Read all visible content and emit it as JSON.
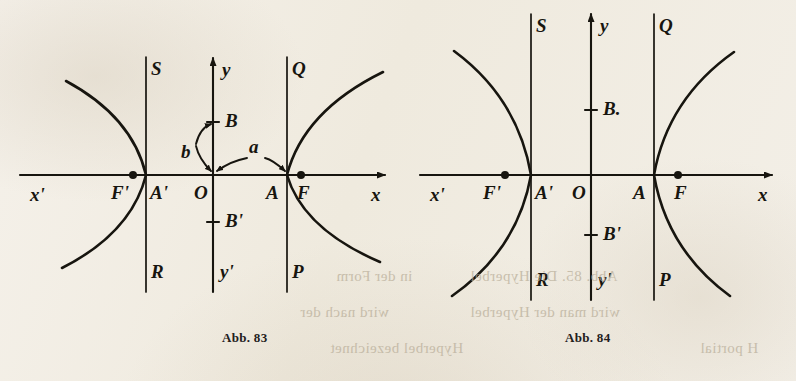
{
  "page": {
    "background_color": "#f2eee6",
    "ink_color": "#17150f",
    "bleed_ink_color": "#b9ae99"
  },
  "bleed_through_text": [
    {
      "text": "Abb. 85.  Die Hyperbel",
      "x": 470,
      "y": 268,
      "size": 15
    },
    {
      "text": "in der Form",
      "x": 336,
      "y": 268,
      "size": 15
    },
    {
      "text": "wird nach der",
      "x": 300,
      "y": 304,
      "size": 15
    },
    {
      "text": "wird man der Hyperbel",
      "x": 470,
      "y": 304,
      "size": 15
    },
    {
      "text": "Hyperbel bezeichnet",
      "x": 330,
      "y": 340,
      "size": 15
    },
    {
      "text": "H portial",
      "x": 700,
      "y": 340,
      "size": 15
    }
  ],
  "figures": [
    {
      "id": "abb-83",
      "caption": "Abb. 83",
      "caption_x": 222,
      "caption_y": 330,
      "geometry": {
        "origin_x": 213,
        "axis_y": 175,
        "x_axis_start": 20,
        "x_axis_end": 385,
        "y_axis_top": 58,
        "y_axis_bottom": 292,
        "vertex_left_x": 146,
        "vertex_right_x": 287,
        "focus_left_x": 133,
        "focus_right_x": 301,
        "b_tick_y": 122,
        "b_prime_tick_y": 222,
        "directrix_top": 57,
        "directrix_bottom": 292,
        "branch_left_top_x": 66,
        "branch_left_top_y": 81,
        "branch_right_top_x": 383,
        "branch_right_top_y": 72,
        "branch_left_bottom_x": 62,
        "branch_left_bottom_y": 268,
        "branch_right_bottom_x": 380,
        "branch_right_bottom_y": 262
      },
      "labels": {
        "x_axis_negative": "x'",
        "x_axis_positive": "x",
        "y_axis_positive": "y",
        "y_axis_negative": "y'",
        "origin": "O",
        "vertex_left": "A'",
        "vertex_right": "A",
        "focus_left": "F'",
        "focus_right": "F",
        "b_upper": "B",
        "b_lower": "B'",
        "directrix_left_upper": "S",
        "directrix_left_lower": "R",
        "directrix_right_upper": "Q",
        "directrix_right_lower": "P",
        "semi_axis_a": "a",
        "semi_axis_b": "b"
      },
      "has_ab_annotations": true
    },
    {
      "id": "abb-84",
      "caption": "Abb. 84",
      "caption_x": 565,
      "caption_y": 330,
      "geometry": {
        "origin_x": 591,
        "axis_y": 175,
        "x_axis_start": 420,
        "x_axis_end": 772,
        "y_axis_top": 14,
        "y_axis_bottom": 300,
        "vertex_left_x": 531,
        "vertex_right_x": 654,
        "focus_left_x": 505,
        "focus_right_x": 678,
        "b_tick_y": 110,
        "b_prime_tick_y": 235,
        "directrix_top": 14,
        "directrix_bottom": 300,
        "branch_left_top_x": 454,
        "branch_left_top_y": 51,
        "branch_right_top_x": 734,
        "branch_right_top_y": 52,
        "branch_left_bottom_x": 452,
        "branch_left_bottom_y": 296,
        "branch_right_bottom_x": 730,
        "branch_right_bottom_y": 296
      },
      "labels": {
        "x_axis_negative": "x'",
        "x_axis_positive": "x",
        "y_axis_positive": "y",
        "y_axis_negative": "y'",
        "origin": "O",
        "vertex_left": "A'",
        "vertex_right": "A",
        "focus_left": "F'",
        "focus_right": "F",
        "b_upper": "B.",
        "b_lower": "B'",
        "directrix_left_upper": "S",
        "directrix_left_lower": "R",
        "directrix_right_upper": "Q",
        "directrix_right_lower": "P"
      },
      "has_ab_annotations": false
    }
  ],
  "chart_data": {
    "type": "line",
    "xlabel": "x",
    "ylabel": "y",
    "charts": [
      {
        "name": "Abb. 83",
        "equation": "x^2/a^2 - y^2/b^2 = 1",
        "semi_major_a_px": 67,
        "semi_minor_b_px": 53,
        "focal_distance_c_px": 80,
        "vertices": [
          [
            -67,
            0
          ],
          [
            67,
            0
          ]
        ],
        "foci": [
          [
            -80,
            0
          ],
          [
            80,
            0
          ]
        ],
        "covertices": [
          [
            0,
            53
          ],
          [
            0,
            -53
          ]
        ],
        "grid": false,
        "legend": "none"
      },
      {
        "name": "Abb. 84",
        "equation": "x^2/a^2 - y^2/b^2 = 1",
        "semi_major_a_px": 60,
        "semi_minor_b_px": 65,
        "focal_distance_c_px": 86,
        "vertices": [
          [
            -60,
            0
          ],
          [
            60,
            0
          ]
        ],
        "foci": [
          [
            -86,
            0
          ],
          [
            86,
            0
          ]
        ],
        "covertices": [
          [
            0,
            65
          ],
          [
            0,
            -65
          ]
        ],
        "grid": false,
        "legend": "none"
      }
    ]
  }
}
